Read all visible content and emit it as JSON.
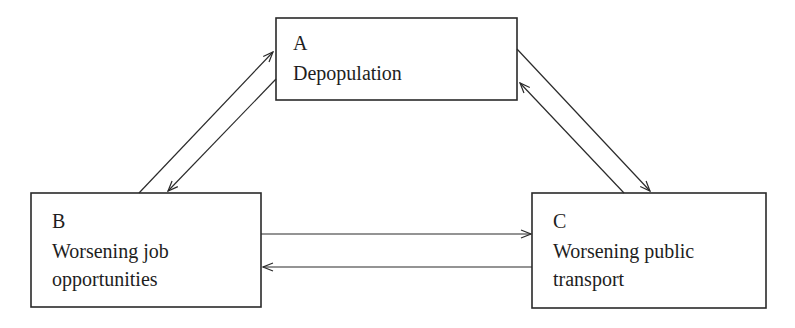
{
  "diagram": {
    "type": "cycle",
    "nodes": {
      "a": {
        "letter": "A",
        "line1": "Depopulation",
        "line2": ""
      },
      "b": {
        "letter": "B",
        "line1": "Worsening job",
        "line2": "opportunities"
      },
      "c": {
        "letter": "C",
        "line1": "Worsening public",
        "line2": "transport"
      }
    },
    "edges": [
      {
        "from": "B",
        "to": "A"
      },
      {
        "from": "A",
        "to": "B"
      },
      {
        "from": "A",
        "to": "C"
      },
      {
        "from": "C",
        "to": "A"
      },
      {
        "from": "B",
        "to": "C"
      },
      {
        "from": "C",
        "to": "B"
      }
    ],
    "colors": {
      "line": "#2a2a2a",
      "text": "#1e1e1e",
      "background": "#ffffff"
    }
  }
}
